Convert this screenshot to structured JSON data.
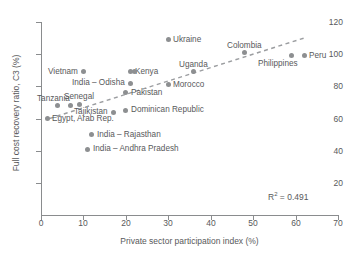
{
  "chart_data": {
    "type": "scatter",
    "title": "",
    "xlabel": "Private sector participation index (%)",
    "ylabel": "Full cost recovery ratio, C3 (%)",
    "xlim": [
      0,
      70
    ],
    "ylim": [
      0,
      120
    ],
    "xticks": [
      0,
      10,
      20,
      30,
      40,
      50,
      60,
      70
    ],
    "yticks": [
      20,
      40,
      60,
      80,
      100,
      120
    ],
    "grid": false,
    "legend": "none",
    "annotation": "R² = 0.491",
    "r_squared": 0.491,
    "trendline": {
      "type": "linear",
      "style": "dashed",
      "x0": 2,
      "y0": 60,
      "x1": 62,
      "y1": 110
    },
    "points": [
      {
        "label": "Egypt, Arab Rep.",
        "x": 1.5,
        "y": 60,
        "label_pos": "right"
      },
      {
        "label": "Tanzania",
        "x": 4,
        "y": 68,
        "label_pos": "above-left"
      },
      {
        "label": "",
        "x": 7,
        "y": 68,
        "label_pos": "none"
      },
      {
        "label": "Senegal",
        "x": 9,
        "y": 69,
        "label_pos": "above"
      },
      {
        "label": "Vietnam",
        "x": 10,
        "y": 89,
        "label_pos": "left"
      },
      {
        "label": "India – Andhra Pradesh",
        "x": 11,
        "y": 41,
        "label_pos": "right"
      },
      {
        "label": "India – Rajasthan",
        "x": 12,
        "y": 50,
        "label_pos": "right"
      },
      {
        "label": "Tajikistan",
        "x": 17,
        "y": 64,
        "label_pos": "left"
      },
      {
        "label": "Dominican Republic",
        "x": 20,
        "y": 65,
        "label_pos": "right"
      },
      {
        "label": "Pakistan",
        "x": 20,
        "y": 76,
        "label_pos": "right"
      },
      {
        "label": "India – Odisha",
        "x": 21,
        "y": 82,
        "label_pos": "left"
      },
      {
        "label": "Kenya",
        "x": 21,
        "y": 89,
        "label_pos": "right"
      },
      {
        "label": "",
        "x": 22,
        "y": 89,
        "label_pos": "none"
      },
      {
        "label": "Ukraine",
        "x": 30,
        "y": 109,
        "label_pos": "right"
      },
      {
        "label": "Morocco",
        "x": 30,
        "y": 81,
        "label_pos": "right"
      },
      {
        "label": "Uganda",
        "x": 36,
        "y": 89,
        "label_pos": "above"
      },
      {
        "label": "Colombia",
        "x": 48,
        "y": 101,
        "label_pos": "above"
      },
      {
        "label": "Philippines",
        "x": 59,
        "y": 99,
        "label_pos": "below-left"
      },
      {
        "label": "Peru",
        "x": 62,
        "y": 99,
        "label_pos": "right"
      }
    ]
  },
  "axes": {
    "x_title": "Private sector participation index (%)",
    "y_title": "Full cost recovery ratio, C3 (%)",
    "x_tick_labels": [
      "0",
      "10",
      "20",
      "30",
      "40",
      "50",
      "60",
      "70"
    ],
    "y_tick_labels": [
      "20",
      "40",
      "60",
      "80",
      "100",
      "120"
    ]
  },
  "annotations": {
    "r2_prefix": "R",
    "r2_sup": "2",
    "r2_value": " = 0.491"
  },
  "colors": {
    "marker": "#8d8f91",
    "axis": "#8a8c8e",
    "text": "#58595b",
    "background": "#ffffff"
  }
}
